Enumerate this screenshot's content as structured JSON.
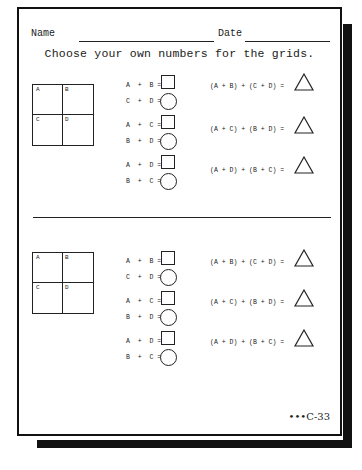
{
  "header": {
    "name_label": "Name",
    "date_label": "Date"
  },
  "title": "Choose your own numbers for the grids.",
  "grid_labels": [
    "A",
    "B",
    "C",
    "D"
  ],
  "sections": [
    {
      "pairs": [
        {
          "top": "A  +  B =",
          "bottom": "C  +  D ="
        },
        {
          "top": "A  +  C =",
          "bottom": "B  +  D ="
        },
        {
          "top": "A  +  D =",
          "bottom": "B  +  C ="
        }
      ],
      "triangles": [
        "(A + B) + (C + D) =",
        "(A + C) + (B + D) =",
        "(A + D) + (B + C) ="
      ]
    },
    {
      "pairs": [
        {
          "top": "A  +  B =",
          "bottom": "C  +  D ="
        },
        {
          "top": "A  +  C =",
          "bottom": "B  +  D ="
        },
        {
          "top": "A  +  D =",
          "bottom": "B  +  C ="
        }
      ],
      "triangles": [
        "(A + B) + (C + D) =",
        "(A + C) + (B + D) =",
        "(A + D) + (B + C) ="
      ]
    }
  ],
  "footer": {
    "page_code": "•••C-33"
  }
}
